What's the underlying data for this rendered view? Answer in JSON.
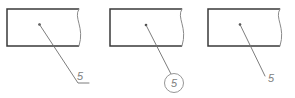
{
  "drawing": {
    "title": "Leader line and balloon callout variants",
    "canvas": {
      "width": 295,
      "height": 98
    },
    "colors": {
      "background": "#ffffff",
      "outline": "#3a3a3a",
      "break_line": "#8a8a8a",
      "leader_line": "#6e6e6e",
      "leader_dot": "#4a4a4a",
      "balloon_stroke": "#8a8a8a",
      "label_text": "#7d7d7d"
    },
    "figures": [
      {
        "id": "figure-1",
        "callout_style": "plain-with-shoulder",
        "label": "5",
        "rect": {
          "x": 7,
          "y": 9,
          "width": 72,
          "height": 37
        },
        "break_curve": "M 79 9 C 73 18, 85 27, 79 46",
        "leader_dot": {
          "cx": 39.5,
          "cy": 24.5,
          "r": 1.3
        },
        "leader_path": "M 39.5 24.5 L 78 83 L 89 83",
        "label_pos": {
          "x": 80,
          "y": 80
        }
      },
      {
        "id": "figure-2",
        "callout_style": "balloon",
        "label": "5",
        "rect": {
          "x": 110,
          "y": 9,
          "width": 72,
          "height": 37
        },
        "break_curve": "M 182 9 C 176 18, 188 27, 182 46",
        "leader_dot": {
          "cx": 146,
          "cy": 25,
          "r": 1.3
        },
        "leader_path": "M 146 25 L 172 76",
        "balloon": {
          "cx": 174,
          "cy": 83,
          "r": 9.5
        },
        "label_pos": {
          "x": 174,
          "y": 87
        }
      },
      {
        "id": "figure-3",
        "callout_style": "plain",
        "label": "5",
        "rect": {
          "x": 208,
          "y": 9,
          "width": 72,
          "height": 37
        },
        "break_curve": "M 280 9 C 274 18, 286 27, 280 46",
        "leader_dot": {
          "cx": 240,
          "cy": 24.5,
          "r": 1.3
        },
        "leader_path": "M 240 24.5 L 265 76",
        "label_pos": {
          "x": 271,
          "y": 82
        }
      }
    ]
  }
}
